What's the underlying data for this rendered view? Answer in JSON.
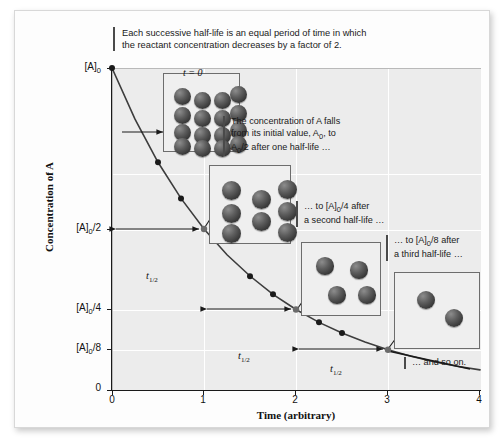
{
  "caption": {
    "line1": "Each successive half-life is an equal period of time in which",
    "line2": "the reactant concentration decreases by a factor of 2."
  },
  "axes": {
    "y_title": "Concentration of A",
    "x_title": "Time (arbitrary)",
    "y_ticks": [
      "[A]0",
      "[A]0/2",
      "[A]0/4",
      "[A]0/8",
      "0"
    ],
    "x_ticks": [
      "0",
      "1",
      "2",
      "3",
      "4"
    ]
  },
  "boxes": [
    {
      "name": "t0-box",
      "time_label": "t = 0",
      "count": 16
    },
    {
      "name": "half1-box",
      "time_label": "",
      "count": 8
    },
    {
      "name": "half2-box",
      "time_label": "",
      "count": 4
    },
    {
      "name": "half3-box",
      "time_label": "",
      "count": 2
    }
  ],
  "notes": {
    "note1_l1": "The concentration of A falls",
    "note1_l2": "from its initial value, A0, to",
    "note1_l3": "A0/2 after one half-life …",
    "note2_l1": "… to [A]0/4 after",
    "note2_l2": "a second half-life …",
    "note3_l1": "… to [A]0/8 after",
    "note3_l2": "a third half-life …",
    "note4": "… and so on."
  },
  "half_life_labels": [
    "t1/2",
    "t1/2",
    "t1/2"
  ],
  "colors": {
    "plot_background": "#ececec",
    "gridline": "#ffffff",
    "curve": "#3d3d3d",
    "sphere": "#4a4a4a",
    "axis": "#1a1a1a",
    "note_rule": "#4a4a4a",
    "box_border": "#6d6d6d"
  },
  "chart_data": {
    "type": "line",
    "title": "",
    "xlabel": "Time (arbitrary)",
    "ylabel": "Concentration of A",
    "xlim": [
      0,
      4
    ],
    "ylim": [
      0,
      1
    ],
    "grid": true,
    "legend": null,
    "x_tick_values": [
      0,
      1,
      2,
      3,
      4
    ],
    "y_tick_values": [
      1,
      0.5,
      0.25,
      0.125,
      0
    ],
    "y_tick_labels": [
      "[A]0",
      "[A]0/2",
      "[A]0/4",
      "[A]0/8",
      "0"
    ],
    "series": [
      {
        "name": "[A] vs time (first-order decay, [A] = [A]0 * 2^-t)",
        "x": [
          0,
          0.25,
          0.5,
          0.75,
          1.0,
          1.25,
          1.5,
          1.75,
          2.0,
          2.25,
          2.5,
          2.75,
          3.0,
          3.25,
          3.5,
          3.75,
          4.0
        ],
        "y": [
          1.0,
          0.841,
          0.707,
          0.595,
          0.5,
          0.42,
          0.354,
          0.297,
          0.25,
          0.21,
          0.177,
          0.149,
          0.125,
          0.105,
          0.088,
          0.074,
          0.0625
        ]
      }
    ],
    "markers_x": [
      0,
      0.5,
      0.75,
      1.0,
      1.5,
      1.75,
      2.0,
      2.25,
      2.5,
      3.0
    ],
    "annotations": [
      {
        "text": "t1/2",
        "x_from": 0,
        "x_to": 1,
        "y": 0.5
      },
      {
        "text": "t1/2",
        "x_from": 1,
        "x_to": 2,
        "y": 0.25
      },
      {
        "text": "t1/2",
        "x_from": 2,
        "x_to": 3,
        "y": 0.125
      }
    ]
  }
}
